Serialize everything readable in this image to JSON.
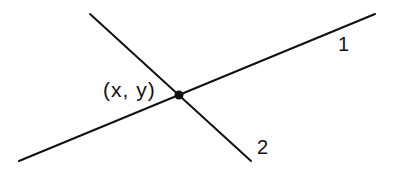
{
  "diagram": {
    "stroke_color": "#111111",
    "background": "#ffffff",
    "lines": [
      {
        "id": "1",
        "label": "1",
        "x1": 19,
        "y1": 161,
        "x2": 375,
        "y2": 14
      },
      {
        "id": "2",
        "label": "2",
        "x1": 90,
        "y1": 14,
        "x2": 251,
        "y2": 161
      }
    ],
    "intersection": {
      "label": "(x, y)",
      "cx": 179,
      "cy": 95,
      "r": 4.5
    }
  }
}
